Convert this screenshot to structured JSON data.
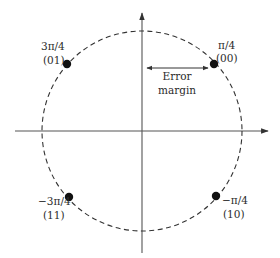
{
  "diagram": {
    "type": "QPSK constellation diagram",
    "colors": {
      "axis": "#555555",
      "circle": "#333333",
      "point": "#111111",
      "text": "#2b2b2b",
      "background": "#ffffff"
    },
    "axes": {
      "horizontal": {
        "x1": 15,
        "y": 131,
        "x2": 268
      },
      "vertical": {
        "x": 142,
        "y1": 253,
        "y2": 13
      }
    },
    "circle": {
      "cx": 142,
      "cy": 131,
      "r": 100,
      "style": "dashed"
    },
    "points": [
      {
        "phase": "π/4",
        "bits": "(00)",
        "x": 214,
        "y": 64
      },
      {
        "phase": "3π/4",
        "bits": "(01)",
        "x": 67,
        "y": 64
      },
      {
        "phase": "−3π/4",
        "bits": "(11)",
        "x": 69,
        "y": 197
      },
      {
        "phase": "−π/4",
        "bits": "(10)",
        "x": 216,
        "y": 196
      }
    ],
    "error_margin": {
      "line1": "Error",
      "line2": "margin",
      "arrow": {
        "x1": 147,
        "x2": 208,
        "y": 68
      }
    }
  }
}
